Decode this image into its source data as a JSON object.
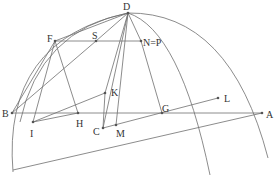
{
  "diagram": {
    "type": "geometric-construction",
    "stroke_color": "#6e6e6e",
    "point_color": "#555555",
    "label_color": "#333333",
    "points": {
      "D": {
        "x": 128,
        "y": 13,
        "label": "D",
        "lx": 123,
        "ly": 10
      },
      "F": {
        "x": 55,
        "y": 41,
        "label": "F",
        "lx": 47,
        "ly": 42
      },
      "S": {
        "x": 96,
        "y": 41,
        "label": "S",
        "lx": 92,
        "ly": 39
      },
      "N": {
        "x": 141,
        "y": 41,
        "label": "N=P",
        "lx": 143,
        "ly": 46
      },
      "B": {
        "x": 12,
        "y": 113,
        "label": "B",
        "lx": 2,
        "ly": 117
      },
      "A": {
        "x": 262,
        "y": 113,
        "label": "A",
        "lx": 266,
        "ly": 118
      },
      "I": {
        "x": 33,
        "y": 122,
        "label": "I",
        "lx": 30,
        "ly": 137
      },
      "H": {
        "x": 78,
        "y": 113,
        "label": "H",
        "lx": 76,
        "ly": 127
      },
      "K": {
        "x": 105,
        "y": 93,
        "label": "K",
        "lx": 111,
        "ly": 96
      },
      "C": {
        "x": 103,
        "y": 128,
        "label": "C",
        "lx": 93,
        "ly": 135
      },
      "M": {
        "x": 116,
        "y": 125,
        "label": "M",
        "lx": 116,
        "ly": 137
      },
      "G": {
        "x": 162,
        "y": 113,
        "label": "G",
        "lx": 162,
        "ly": 112
      },
      "L": {
        "x": 218,
        "y": 98,
        "label": "L",
        "lx": 224,
        "ly": 102
      }
    },
    "segments": [
      [
        "B",
        "A"
      ],
      [
        "F",
        "N"
      ],
      [
        "D",
        "F"
      ],
      [
        "D",
        "K"
      ],
      [
        "D",
        "C"
      ],
      [
        "D",
        "M"
      ],
      [
        "D",
        "N"
      ],
      [
        "N",
        "G"
      ],
      [
        "F",
        "B"
      ],
      [
        "F",
        "I"
      ],
      [
        "F",
        "H"
      ],
      [
        "I",
        "H"
      ],
      [
        "I",
        "K"
      ],
      [
        "K",
        "C"
      ],
      [
        "C",
        "L"
      ],
      [
        "B",
        "S"
      ],
      [
        "S",
        "D"
      ]
    ],
    "extra_lines": [
      {
        "x1": 13,
        "y1": 170,
        "x2": 262,
        "y2": 113
      }
    ],
    "arcs": [
      {
        "d": "M 13 172 Q 2 40 128 13 Q 230 12 268 158"
      },
      {
        "d": "M 20 122 Q 40 30 128 13 Q 180 30 210 175"
      }
    ]
  }
}
